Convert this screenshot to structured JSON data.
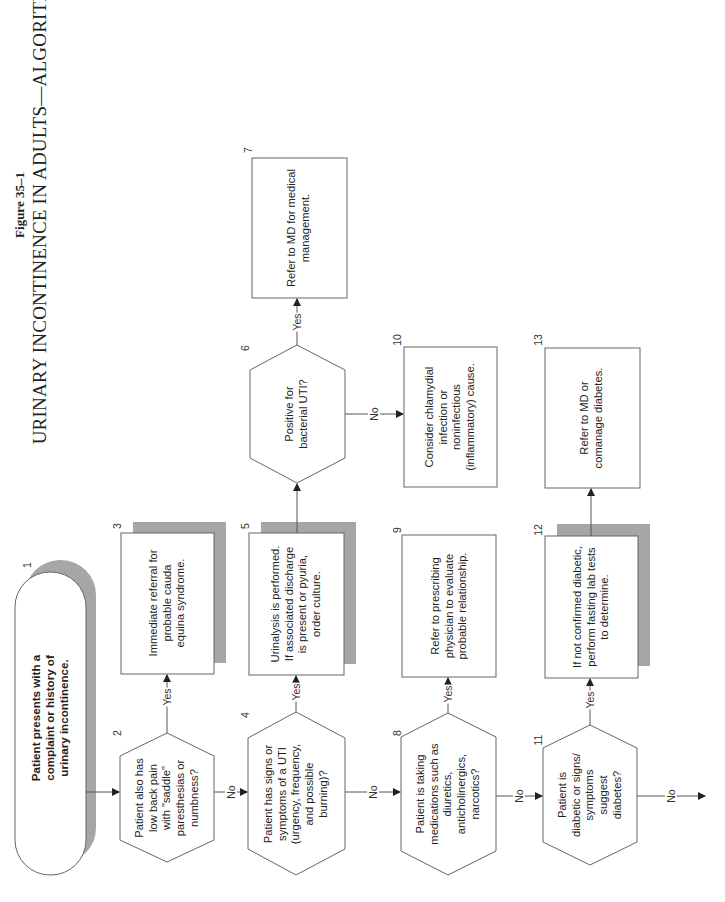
{
  "figure": {
    "label": "Figure 35–1",
    "title": "URINARY INCONTINENCE IN ADULTS—ALGORITHM."
  },
  "colors": {
    "line": "#555555",
    "shadow": "#a6a6a6",
    "box_border": "#666666"
  },
  "nodes": [
    {
      "id": "1",
      "shape": "terminal",
      "text": [
        "Patient presents with a",
        "complaint or history of",
        "urinary incontinence."
      ]
    },
    {
      "id": "2",
      "shape": "decision",
      "text": [
        "Patient also has",
        "low back pain",
        "with \"saddle\"",
        "paresthesias or",
        "numbness?"
      ]
    },
    {
      "id": "3",
      "shape": "process-shadow",
      "text": [
        "Immediate referral for",
        "probable cauda",
        "equina syndrome."
      ]
    },
    {
      "id": "4",
      "shape": "decision",
      "text": [
        "Patient has signs or",
        "symptoms of a UTI",
        "(urgency, frequency,",
        "and possible",
        "burning)?"
      ]
    },
    {
      "id": "5",
      "shape": "process-shadow",
      "text": [
        "Urinalysis is performed.",
        "If associated discharge",
        "is present or pyuria,",
        "order culture."
      ]
    },
    {
      "id": "6",
      "shape": "decision",
      "text": [
        "Positive for",
        "bacterial UTI?"
      ]
    },
    {
      "id": "7",
      "shape": "process",
      "text": [
        "Refer to MD for medical",
        "management."
      ]
    },
    {
      "id": "8",
      "shape": "decision",
      "text": [
        "Patient is taking",
        "medications such as",
        "diuretics,",
        "anticholinergics,",
        "narcotics?"
      ]
    },
    {
      "id": "9",
      "shape": "process",
      "text": [
        "Refer to prescribing",
        "physician to evaluate",
        "probable relationship."
      ]
    },
    {
      "id": "10",
      "shape": "process",
      "text": [
        "Consider chlamydial",
        "infection or",
        "noninfectious",
        "(inflammatory) cause."
      ]
    },
    {
      "id": "11",
      "shape": "decision",
      "text": [
        "Patient is",
        "diabetic or signs/",
        "symptoms",
        "suggest",
        "diabetes?"
      ]
    },
    {
      "id": "12",
      "shape": "process-shadow",
      "text": [
        "If not confirmed diabetic,",
        "perform fasting lab tests",
        "to determine."
      ]
    },
    {
      "id": "13",
      "shape": "process",
      "text": [
        "Refer to MD or",
        "comanage diabetes."
      ]
    }
  ],
  "edges": [
    {
      "from": "1",
      "to": "2",
      "label": ""
    },
    {
      "from": "2",
      "to": "3",
      "label": "Yes"
    },
    {
      "from": "2",
      "to": "4",
      "label": "No"
    },
    {
      "from": "4",
      "to": "5",
      "label": "Yes"
    },
    {
      "from": "4",
      "to": "8",
      "label": "No"
    },
    {
      "from": "5",
      "to": "6",
      "label": ""
    },
    {
      "from": "6",
      "to": "7",
      "label": "Yes"
    },
    {
      "from": "6",
      "to": "10",
      "label": "No"
    },
    {
      "from": "8",
      "to": "9",
      "label": "Yes"
    },
    {
      "from": "8",
      "to": "11",
      "label": "No"
    },
    {
      "from": "11",
      "to": "12",
      "label": "Yes"
    },
    {
      "from": "11",
      "to": "continue",
      "label": "No"
    },
    {
      "from": "12",
      "to": "13",
      "label": ""
    }
  ],
  "text": {
    "n1": "Patient presents with a\ncomplaint or history of\nurinary incontinence.",
    "n2": "Patient also has\nlow back pain\nwith \"saddle\"\nparesthesias or\nnumbness?",
    "n3": "Immediate referral for\nprobable cauda\nequina syndrome.",
    "n4": "Patient has signs or\nsymptoms of a UTI\n(urgency, frequency,\nand possible\nburning)?",
    "n5": "Urinalysis is performed.\nIf associated discharge\nis present or pyuria,\norder culture.",
    "n6": "Positive for\nbacterial UTI?",
    "n7": "Refer to MD for medical\nmanagement.",
    "n8": "Patient is taking\nmedications such as\ndiuretics,\nanticholinergics,\nnarcotics?",
    "n9": "Refer to prescribing\nphysician to evaluate\nprobable relationship.",
    "n10": "Consider chlamydial\ninfection or\nnoninfectious\n(inflammatory) cause.",
    "n11": "Patient is\ndiabetic or signs/\nsymptoms\nsuggest\ndiabetes?",
    "n12": "If not confirmed diabetic,\nperform fasting lab tests\nto determine.",
    "n13": "Refer to MD or\ncomanage diabetes.",
    "yes": "Yes",
    "no": "No",
    "num": {
      "1": "1",
      "2": "2",
      "3": "3",
      "4": "4",
      "5": "5",
      "6": "6",
      "7": "7",
      "8": "8",
      "9": "9",
      "10": "10",
      "11": "11",
      "12": "12",
      "13": "13"
    }
  }
}
